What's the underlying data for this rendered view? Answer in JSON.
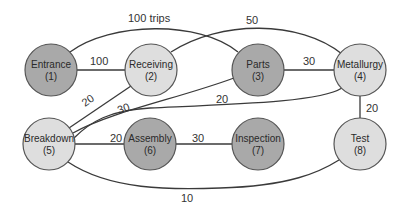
{
  "diagram": {
    "type": "relationship-flow-graph",
    "colors": {
      "dark_node": "#a9a9a9",
      "light_node": "#dedede",
      "edge": "#3a3a3a",
      "background": "#ffffff"
    },
    "nodes": [
      {
        "id": 1,
        "name": "Entrance",
        "num": "(1)",
        "shade": "dark"
      },
      {
        "id": 2,
        "name": "Receiving",
        "num": "(2)",
        "shade": "light"
      },
      {
        "id": 3,
        "name": "Parts",
        "num": "(3)",
        "shade": "dark"
      },
      {
        "id": 4,
        "name": "Metallurgy",
        "num": "(4)",
        "shade": "light"
      },
      {
        "id": 5,
        "name": "Breakdown",
        "num": "(5)",
        "shade": "light"
      },
      {
        "id": 6,
        "name": "Assembly",
        "num": "(6)",
        "shade": "dark"
      },
      {
        "id": 7,
        "name": "Inspection",
        "num": "(7)",
        "shade": "dark"
      },
      {
        "id": 8,
        "name": "Test",
        "num": "(8)",
        "shade": "light"
      }
    ],
    "edges": [
      {
        "from": 1,
        "to": 2,
        "label": "100"
      },
      {
        "from": 1,
        "to": 3,
        "label": "100 trips"
      },
      {
        "from": 2,
        "to": 4,
        "label": "50"
      },
      {
        "from": 3,
        "to": 4,
        "label": "30"
      },
      {
        "from": 2,
        "to": 5,
        "label": "20"
      },
      {
        "from": 3,
        "to": 5,
        "label": "30"
      },
      {
        "from": 4,
        "to": 5,
        "label": "20"
      },
      {
        "from": 5,
        "to": 6,
        "label": "20"
      },
      {
        "from": 6,
        "to": 7,
        "label": "30"
      },
      {
        "from": 4,
        "to": 8,
        "label": "20"
      },
      {
        "from": 5,
        "to": 8,
        "label": "10"
      }
    ]
  }
}
